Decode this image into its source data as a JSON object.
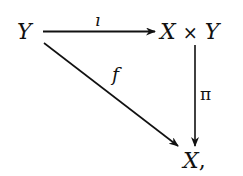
{
  "diagram": {
    "type": "commutative-diagram",
    "nodes": {
      "source": {
        "label": "Y"
      },
      "product": {
        "left": "X",
        "op": "×",
        "right": "Y"
      },
      "target": {
        "label": "X",
        "punct": ","
      }
    },
    "arrows": {
      "top": {
        "from": "Y",
        "to": "X × Y",
        "label": "ı"
      },
      "diagonal": {
        "from": "Y",
        "to": "X",
        "label": "f"
      },
      "vertical": {
        "from": "X × Y",
        "to": "X",
        "label": "π"
      }
    },
    "colors": {
      "ink": "#111111",
      "background": "#ffffff"
    }
  }
}
